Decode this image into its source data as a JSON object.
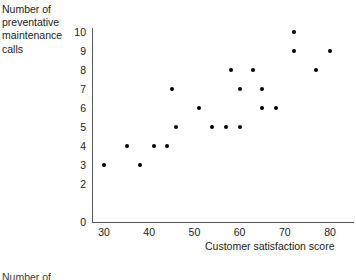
{
  "chart_data": {
    "type": "scatter",
    "title": "",
    "ylabel": "Number of\npreventative\nmaintenance\ncalls",
    "xlabel": "Customer satisfaction score",
    "xlim": [
      25,
      83
    ],
    "ylim": [
      0,
      10.6
    ],
    "xticks": [
      30,
      40,
      50,
      60,
      70,
      80
    ],
    "yticks": [
      0,
      2,
      3,
      4,
      5,
      6,
      7,
      8,
      9,
      10
    ],
    "ytick_labels": [
      "0",
      "2",
      "3",
      "4",
      "5",
      "6",
      "7",
      "8",
      "9",
      "10"
    ],
    "xtick_labels": [
      "30",
      "40",
      "50",
      "60",
      "70",
      "80"
    ],
    "grid": false,
    "legend": false,
    "marker_color": "#000000",
    "axis_color": "#58595b",
    "points": [
      {
        "x": 30,
        "y": 3
      },
      {
        "x": 35,
        "y": 4
      },
      {
        "x": 38,
        "y": 3
      },
      {
        "x": 41,
        "y": 4
      },
      {
        "x": 44,
        "y": 4
      },
      {
        "x": 45,
        "y": 7
      },
      {
        "x": 46,
        "y": 5
      },
      {
        "x": 51,
        "y": 6
      },
      {
        "x": 54,
        "y": 5
      },
      {
        "x": 57,
        "y": 5
      },
      {
        "x": 60,
        "y": 5
      },
      {
        "x": 58,
        "y": 8
      },
      {
        "x": 63,
        "y": 8
      },
      {
        "x": 60,
        "y": 7
      },
      {
        "x": 65,
        "y": 7
      },
      {
        "x": 65,
        "y": 6
      },
      {
        "x": 68,
        "y": 6
      },
      {
        "x": 72,
        "y": 10
      },
      {
        "x": 72,
        "y": 9
      },
      {
        "x": 77,
        "y": 8
      },
      {
        "x": 80,
        "y": 9
      }
    ]
  },
  "page": {
    "bottom_fragment": "Number of"
  }
}
